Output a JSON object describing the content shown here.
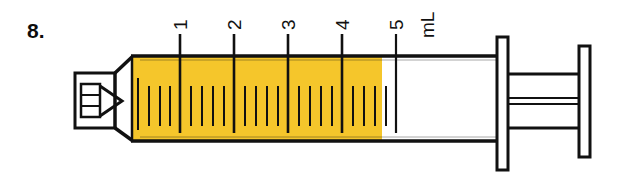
{
  "question": {
    "number_label": "8."
  },
  "figure": {
    "kind": "syringe-diagram",
    "unit_label": "mL",
    "capacity_ml": 5,
    "fill_volume_ml": 4.8,
    "fill_color": "#F5C62B",
    "outline_color": "#111111",
    "background_color": "#FFFFFF",
    "major_tick_labels": [
      "1",
      "2",
      "3",
      "4",
      "5"
    ],
    "minor_ticks_per_major": 4,
    "minor_tick_increment_ml": 0.2,
    "label_rotation_deg": -90,
    "parts": {
      "luer_tip": "luer-tip",
      "barrel": "barrel",
      "fill": "liquid-fill",
      "plunger_rod": "plunger-rod",
      "plunger_flange": "plunger-flange",
      "thumb_rest": "thumb-rest"
    }
  }
}
